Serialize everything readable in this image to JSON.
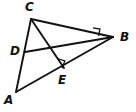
{
  "figure": {
    "background_color": "#fefefe",
    "stroke_color": "#111111",
    "width": 136,
    "height": 112,
    "labels": {
      "c": "C",
      "b": "B",
      "d": "D",
      "e": "E",
      "a": "A"
    },
    "label_positions": {
      "c": {
        "x": 25,
        "y": 1
      },
      "b": {
        "x": 120,
        "y": 31
      },
      "d": {
        "x": 10,
        "y": 45
      },
      "e": {
        "x": 58,
        "y": 74
      },
      "a": {
        "x": 4,
        "y": 94
      }
    },
    "points": {
      "A": {
        "x": 16,
        "y": 92
      },
      "B": {
        "x": 113,
        "y": 37
      },
      "C": {
        "x": 31,
        "y": 19
      },
      "D": {
        "x": 25,
        "y": 52
      },
      "E": {
        "x": 64,
        "y": 68
      }
    },
    "segments": [
      {
        "name": "side-CA",
        "from": "C",
        "to": "A"
      },
      {
        "name": "side-CB",
        "from": "C",
        "to": "B"
      },
      {
        "name": "side-AB",
        "from": "A",
        "to": "B"
      },
      {
        "name": "cevian-CE",
        "from": "C",
        "to": "E"
      },
      {
        "name": "cevian-DB",
        "from": "D",
        "to": "B"
      }
    ],
    "right_angles": [
      {
        "name": "right-angle-at-E",
        "vertex": "E",
        "description": "CE perpendicular to AB"
      },
      {
        "name": "right-angle-near-B",
        "vertex": "B",
        "description": "angle between DB and CB marked"
      }
    ]
  }
}
